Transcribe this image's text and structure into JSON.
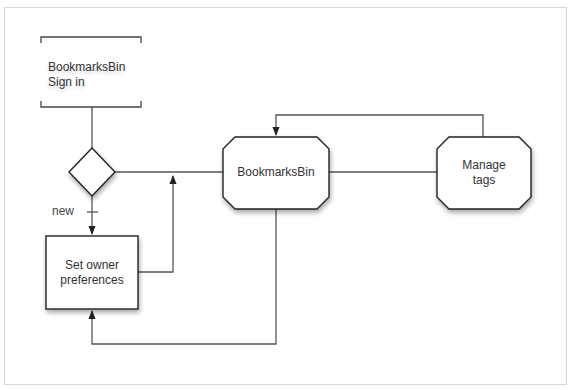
{
  "diagram": {
    "type": "flowchart",
    "colors": {
      "line": "#555555",
      "node_border": "#333333",
      "node_fill": "#ffffff",
      "text": "#333333",
      "frame_border": "#d8d8d8"
    },
    "nodes": {
      "signin": {
        "shape": "bracket",
        "lines": [
          "BookmarksBin",
          "Sign in"
        ]
      },
      "decision": {
        "shape": "diamond",
        "label": ""
      },
      "owner_prefs": {
        "shape": "rectangle",
        "lines": [
          "Set owner",
          "preferences"
        ]
      },
      "bookmarksbin": {
        "shape": "octagon",
        "lines": [
          "BookmarksBin"
        ]
      },
      "manage_tags": {
        "shape": "octagon",
        "lines": [
          "Manage",
          "tags"
        ]
      }
    },
    "edges": [
      {
        "from": "signin",
        "to": "decision",
        "label": ""
      },
      {
        "from": "decision",
        "to": "owner_prefs",
        "label": "new"
      },
      {
        "from": "decision",
        "to": "bookmarksbin",
        "label": ""
      },
      {
        "from": "owner_prefs",
        "to": "bookmarksbin",
        "label": ""
      },
      {
        "from": "bookmarksbin",
        "to": "manage_tags",
        "label": ""
      },
      {
        "from": "manage_tags",
        "to": "bookmarksbin",
        "label": ""
      },
      {
        "from": "bookmarksbin",
        "to": "owner_prefs",
        "label": ""
      }
    ]
  }
}
